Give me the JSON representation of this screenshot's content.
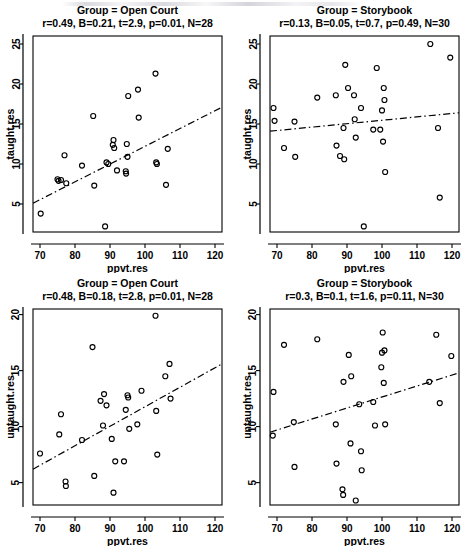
{
  "figure": {
    "layout": "2x2 grid of scatterplots",
    "panel_order": [
      "top-left",
      "top-right",
      "bottom-left",
      "bottom-right"
    ]
  },
  "chart_data": [
    {
      "type": "scatter",
      "panel": "top-left",
      "title": "Group = Open Court",
      "subtitle": "r=0.49, B=0.21, t=2.9, p=0.01, N=28",
      "stats": {
        "r": 0.49,
        "B": 0.21,
        "t": 2.9,
        "p": 0.01,
        "N": 28
      },
      "xlabel": "ppvt.res",
      "ylabel": "taught.res",
      "xlim": [
        68,
        122
      ],
      "ylim": [
        1.5,
        26
      ],
      "xticks": [
        70,
        80,
        90,
        100,
        110,
        120
      ],
      "yticks": [
        5,
        10,
        15,
        20,
        25
      ],
      "grid": false,
      "legend": "none",
      "marker": "open-circle",
      "points": [
        [
          70.2,
          3.8
        ],
        [
          75.0,
          8.1
        ],
        [
          75.3,
          7.9
        ],
        [
          76.0,
          8.0
        ],
        [
          77.0,
          11.1
        ],
        [
          77.5,
          7.6
        ],
        [
          82.0,
          9.8
        ],
        [
          85.2,
          16.0
        ],
        [
          85.5,
          7.3
        ],
        [
          88.6,
          2.2
        ],
        [
          89.0,
          10.2
        ],
        [
          89.5,
          10.0
        ],
        [
          90.8,
          12.4
        ],
        [
          91.0,
          13.0
        ],
        [
          91.2,
          12.0
        ],
        [
          92.0,
          9.2
        ],
        [
          94.5,
          9.1
        ],
        [
          94.6,
          8.8
        ],
        [
          94.8,
          12.5
        ],
        [
          95.0,
          10.9
        ],
        [
          95.2,
          18.5
        ],
        [
          98.0,
          19.3
        ],
        [
          98.2,
          15.8
        ],
        [
          103.0,
          21.3
        ],
        [
          103.2,
          10.2
        ],
        [
          103.4,
          10.0
        ],
        [
          106.0,
          7.4
        ],
        [
          106.5,
          11.9
        ]
      ],
      "regression_line": {
        "x": [
          68,
          122
        ],
        "y": [
          5.1,
          17.1
        ]
      },
      "regression_style": "dash-dot"
    },
    {
      "type": "scatter",
      "panel": "top-right",
      "title": "Group = Storybook",
      "subtitle": "r=0.13, B=0.05, t=0.7, p=0.49, N=30",
      "stats": {
        "r": 0.13,
        "B": 0.05,
        "t": 0.7,
        "p": 0.49,
        "N": 30
      },
      "xlabel": "ppvt.res",
      "ylabel": "taught.res",
      "xlim": [
        68,
        122
      ],
      "ylim": [
        1.5,
        26
      ],
      "xticks": [
        70,
        80,
        90,
        100,
        110,
        120
      ],
      "yticks": [
        5,
        10,
        15,
        20,
        25
      ],
      "grid": false,
      "legend": "none",
      "marker": "open-circle",
      "points": [
        [
          69.0,
          17.0
        ],
        [
          69.3,
          15.4
        ],
        [
          72.0,
          12.0
        ],
        [
          75.0,
          15.3
        ],
        [
          75.2,
          10.9
        ],
        [
          81.5,
          18.3
        ],
        [
          86.8,
          18.6
        ],
        [
          87.0,
          12.3
        ],
        [
          88.0,
          11.0
        ],
        [
          89.0,
          14.5
        ],
        [
          89.2,
          10.6
        ],
        [
          89.5,
          22.4
        ],
        [
          90.3,
          19.5
        ],
        [
          92.0,
          18.6
        ],
        [
          92.2,
          15.6
        ],
        [
          92.5,
          13.3
        ],
        [
          94.0,
          17.0
        ],
        [
          94.8,
          2.2
        ],
        [
          97.5,
          14.3
        ],
        [
          98.5,
          22.0
        ],
        [
          99.5,
          14.3
        ],
        [
          100.0,
          16.7
        ],
        [
          100.3,
          12.8
        ],
        [
          100.5,
          19.5
        ],
        [
          100.7,
          18.0
        ],
        [
          100.9,
          9.0
        ],
        [
          113.8,
          25.0
        ],
        [
          116.0,
          14.5
        ],
        [
          116.5,
          5.8
        ],
        [
          119.5,
          23.3
        ]
      ],
      "regression_line": {
        "x": [
          68,
          122
        ],
        "y": [
          14.1,
          16.4
        ]
      },
      "regression_style": "dash-dot"
    },
    {
      "type": "scatter",
      "panel": "bottom-left",
      "title": "Group = Open Court",
      "subtitle": "r=0.48, B=0.18, t=2.8, p=0.01, N=28",
      "stats": {
        "r": 0.48,
        "B": 0.18,
        "t": 2.8,
        "p": 0.01,
        "N": 28
      },
      "xlabel": "ppvt.res",
      "ylabel": "untaught.res",
      "xlim": [
        68,
        122
      ],
      "ylim": [
        3.0,
        20.5
      ],
      "xticks": [
        70,
        80,
        90,
        100,
        110,
        120
      ],
      "yticks": [
        5,
        10,
        15,
        20
      ],
      "grid": false,
      "legend": "none",
      "marker": "open-circle",
      "points": [
        [
          70.0,
          7.6
        ],
        [
          75.5,
          9.3
        ],
        [
          76.0,
          11.1
        ],
        [
          77.3,
          5.1
        ],
        [
          77.4,
          4.7
        ],
        [
          82.0,
          8.8
        ],
        [
          85.0,
          17.1
        ],
        [
          85.5,
          5.6
        ],
        [
          87.3,
          12.3
        ],
        [
          88.0,
          10.1
        ],
        [
          88.3,
          12.9
        ],
        [
          89.0,
          11.9
        ],
        [
          90.5,
          8.9
        ],
        [
          91.0,
          4.1
        ],
        [
          91.5,
          6.9
        ],
        [
          94.0,
          6.9
        ],
        [
          94.5,
          11.5
        ],
        [
          95.0,
          12.8
        ],
        [
          95.2,
          12.6
        ],
        [
          95.5,
          9.8
        ],
        [
          97.8,
          10.2
        ],
        [
          99.0,
          13.2
        ],
        [
          103.0,
          19.9
        ],
        [
          103.2,
          11.4
        ],
        [
          103.5,
          7.5
        ],
        [
          105.8,
          14.5
        ],
        [
          107.0,
          15.6
        ],
        [
          107.3,
          12.5
        ]
      ],
      "regression_line": {
        "x": [
          68,
          122
        ],
        "y": [
          6.2,
          15.6
        ]
      },
      "regression_style": "dash-dot"
    },
    {
      "type": "scatter",
      "panel": "bottom-right",
      "title": "Group = Storybook",
      "subtitle": "r=0.3, B=0.1, t=1.6, p=0.11, N=30",
      "stats": {
        "r": 0.3,
        "B": 0.1,
        "t": 1.6,
        "p": 0.11,
        "N": 30
      },
      "xlabel": "ppvt.res",
      "ylabel": "untaught.res",
      "xlim": [
        68,
        122
      ],
      "ylim": [
        3.0,
        20.5
      ],
      "xticks": [
        70,
        80,
        90,
        100,
        110,
        120
      ],
      "yticks": [
        5,
        10,
        15,
        20
      ],
      "grid": false,
      "legend": "none",
      "marker": "open-circle",
      "points": [
        [
          68.8,
          9.2
        ],
        [
          69.0,
          13.1
        ],
        [
          72.0,
          17.3
        ],
        [
          74.8,
          10.4
        ],
        [
          75.0,
          6.4
        ],
        [
          81.5,
          17.8
        ],
        [
          86.8,
          10.2
        ],
        [
          87.0,
          6.7
        ],
        [
          88.7,
          4.4
        ],
        [
          88.9,
          3.9
        ],
        [
          89.0,
          14.0
        ],
        [
          90.5,
          16.4
        ],
        [
          91.0,
          8.5
        ],
        [
          91.2,
          14.5
        ],
        [
          92.5,
          3.4
        ],
        [
          93.5,
          12.0
        ],
        [
          94.0,
          7.8
        ],
        [
          94.2,
          6.1
        ],
        [
          97.5,
          12.2
        ],
        [
          98.0,
          10.1
        ],
        [
          99.8,
          15.3
        ],
        [
          100.0,
          16.6
        ],
        [
          100.2,
          18.4
        ],
        [
          100.5,
          13.9
        ],
        [
          100.7,
          16.8
        ],
        [
          100.9,
          10.2
        ],
        [
          113.5,
          14.0
        ],
        [
          115.5,
          18.2
        ],
        [
          116.5,
          12.1
        ],
        [
          119.8,
          16.3
        ]
      ],
      "regression_line": {
        "x": [
          68,
          122
        ],
        "y": [
          9.5,
          14.8
        ]
      },
      "regression_style": "dash-dot"
    }
  ]
}
